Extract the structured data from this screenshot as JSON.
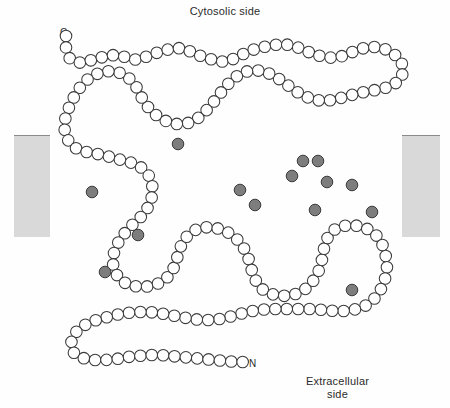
{
  "figure": {
    "type": "membrane-protein-topology-diagram",
    "title_top": "Cytosolic side",
    "label_bottom": "Extracellular\nside",
    "terminus_c": "C",
    "terminus_n": "N",
    "colors": {
      "background": "#fefefe",
      "residue_fill": "#ffffff",
      "residue_outline": "#3a3a3a",
      "highlighted_residue_fill": "#7d7d7d",
      "membrane_bar": "#d9d9d9",
      "membrane_bar_edge": "#8a8a8a",
      "text": "#2b2b2b"
    },
    "membrane_bars": [
      {
        "name": "membrane-bar-left",
        "x": 14,
        "y": 135,
        "w": 36,
        "h": 102
      },
      {
        "name": "membrane-bar-right",
        "x": 402,
        "y": 135,
        "w": 38,
        "h": 102
      }
    ],
    "residue_radius": 5.8,
    "residue_spacing": 11.4,
    "chain_path": [
      [
        66,
        36
      ],
      [
        66,
        48
      ],
      [
        70,
        59
      ],
      [
        81,
        63
      ],
      [
        92,
        60
      ],
      [
        103,
        57
      ],
      [
        114,
        55
      ],
      [
        126,
        57
      ],
      [
        137,
        60
      ],
      [
        148,
        56
      ],
      [
        159,
        52
      ],
      [
        170,
        49
      ],
      [
        181,
        48
      ],
      [
        192,
        52
      ],
      [
        203,
        57
      ],
      [
        214,
        60
      ],
      [
        225,
        62
      ],
      [
        236,
        58
      ],
      [
        247,
        52
      ],
      [
        258,
        48
      ],
      [
        269,
        46
      ],
      [
        280,
        44
      ],
      [
        291,
        45
      ],
      [
        302,
        49
      ],
      [
        313,
        54
      ],
      [
        324,
        57
      ],
      [
        335,
        58
      ],
      [
        346,
        55
      ],
      [
        357,
        50
      ],
      [
        368,
        47
      ],
      [
        379,
        47
      ],
      [
        390,
        51
      ],
      [
        399,
        58
      ],
      [
        404,
        68
      ],
      [
        401,
        79
      ],
      [
        392,
        86
      ],
      [
        381,
        89
      ],
      [
        370,
        91
      ],
      [
        359,
        93
      ],
      [
        348,
        96
      ],
      [
        337,
        99
      ],
      [
        326,
        101
      ],
      [
        315,
        100
      ],
      [
        304,
        96
      ],
      [
        294,
        90
      ],
      [
        285,
        83
      ],
      [
        276,
        77
      ],
      [
        266,
        72
      ],
      [
        255,
        70
      ],
      [
        244,
        72
      ],
      [
        234,
        78
      ],
      [
        226,
        86
      ],
      [
        219,
        95
      ],
      [
        212,
        104
      ],
      [
        205,
        112
      ],
      [
        197,
        119
      ],
      [
        188,
        123
      ],
      [
        177,
        124
      ],
      [
        166,
        121
      ],
      [
        156,
        115
      ],
      [
        148,
        107
      ],
      [
        142,
        98
      ],
      [
        137,
        88
      ],
      [
        130,
        79
      ],
      [
        121,
        73
      ],
      [
        110,
        71
      ],
      [
        99,
        73
      ],
      [
        89,
        78
      ],
      [
        81,
        86
      ],
      [
        75,
        95
      ],
      [
        70,
        105
      ],
      [
        66,
        115
      ],
      [
        64,
        126
      ],
      [
        66,
        137
      ],
      [
        72,
        146
      ],
      [
        81,
        151
      ],
      [
        92,
        153
      ],
      [
        103,
        155
      ],
      [
        114,
        158
      ],
      [
        125,
        161
      ],
      [
        136,
        164
      ],
      [
        145,
        170
      ],
      [
        151,
        179
      ],
      [
        153,
        190
      ],
      [
        151,
        201
      ],
      [
        146,
        211
      ],
      [
        139,
        219
      ],
      [
        131,
        226
      ],
      [
        124,
        234
      ],
      [
        118,
        243
      ],
      [
        114,
        253
      ],
      [
        113,
        264
      ],
      [
        116,
        274
      ],
      [
        123,
        282
      ],
      [
        133,
        286
      ],
      [
        144,
        287
      ],
      [
        155,
        285
      ],
      [
        165,
        280
      ],
      [
        172,
        272
      ],
      [
        176,
        262
      ],
      [
        179,
        251
      ],
      [
        183,
        241
      ],
      [
        190,
        233
      ],
      [
        199,
        228
      ],
      [
        210,
        227
      ],
      [
        221,
        229
      ],
      [
        231,
        234
      ],
      [
        239,
        241
      ],
      [
        245,
        250
      ],
      [
        249,
        260
      ],
      [
        252,
        271
      ],
      [
        256,
        281
      ],
      [
        262,
        289
      ],
      [
        271,
        294
      ],
      [
        282,
        296
      ],
      [
        293,
        295
      ],
      [
        303,
        291
      ],
      [
        311,
        284
      ],
      [
        317,
        275
      ],
      [
        321,
        265
      ],
      [
        323,
        254
      ],
      [
        325,
        243
      ],
      [
        330,
        233
      ],
      [
        338,
        227
      ],
      [
        349,
        225
      ],
      [
        360,
        226
      ],
      [
        370,
        230
      ],
      [
        378,
        237
      ],
      [
        383,
        246
      ],
      [
        386,
        257
      ],
      [
        387,
        268
      ],
      [
        385,
        279
      ],
      [
        381,
        289
      ],
      [
        375,
        298
      ],
      [
        367,
        305
      ],
      [
        357,
        309
      ],
      [
        346,
        311
      ],
      [
        335,
        311
      ],
      [
        324,
        310
      ],
      [
        313,
        309
      ],
      [
        302,
        309
      ],
      [
        291,
        309
      ],
      [
        280,
        309
      ],
      [
        269,
        309
      ],
      [
        258,
        310
      ],
      [
        247,
        312
      ],
      [
        236,
        315
      ],
      [
        225,
        318
      ],
      [
        214,
        320
      ],
      [
        203,
        320
      ],
      [
        192,
        319
      ],
      [
        181,
        317
      ],
      [
        170,
        315
      ],
      [
        159,
        313
      ],
      [
        148,
        312
      ],
      [
        137,
        312
      ],
      [
        126,
        313
      ],
      [
        115,
        315
      ],
      [
        104,
        318
      ],
      [
        93,
        321
      ],
      [
        83,
        326
      ],
      [
        75,
        333
      ],
      [
        71,
        343
      ],
      [
        74,
        353
      ],
      [
        83,
        358
      ],
      [
        94,
        360
      ],
      [
        105,
        360
      ],
      [
        116,
        359
      ],
      [
        127,
        357
      ],
      [
        138,
        356
      ],
      [
        149,
        355
      ],
      [
        160,
        355
      ],
      [
        171,
        356
      ],
      [
        182,
        357
      ],
      [
        193,
        358
      ],
      [
        204,
        359
      ],
      [
        215,
        360
      ],
      [
        226,
        361
      ],
      [
        237,
        362
      ],
      [
        247,
        362
      ]
    ],
    "highlighted_residue_indices": [],
    "highlighted_residues": [
      {
        "x": 178,
        "y": 144
      },
      {
        "x": 92,
        "y": 192
      },
      {
        "x": 138,
        "y": 235
      },
      {
        "x": 105,
        "y": 272
      },
      {
        "x": 240,
        "y": 190
      },
      {
        "x": 255,
        "y": 205
      },
      {
        "x": 303,
        "y": 161
      },
      {
        "x": 318,
        "y": 161
      },
      {
        "x": 292,
        "y": 176
      },
      {
        "x": 327,
        "y": 182
      },
      {
        "x": 315,
        "y": 210
      },
      {
        "x": 352,
        "y": 185
      },
      {
        "x": 372,
        "y": 212
      },
      {
        "x": 352,
        "y": 290
      }
    ],
    "helices": [
      {
        "name": "transmembrane-helix-1",
        "top": [
          77,
          137
        ],
        "bottom": [
          118,
          248
        ]
      },
      {
        "name": "transmembrane-helix-2",
        "top": [
          142,
          100
        ],
        "bottom": [
          175,
          263
        ]
      },
      {
        "name": "transmembrane-helix-3",
        "top": [
          206,
          112
        ],
        "bottom": [
          180,
          250
        ]
      },
      {
        "name": "transmembrane-helix-4",
        "top": [
          249,
          260
        ],
        "bottom": [
          246,
          252
        ]
      },
      {
        "name": "transmembrane-helix-5",
        "top": [
          285,
          84
        ],
        "bottom": [
          319,
          272
        ]
      },
      {
        "name": "transmembrane-helix-6",
        "top": [
          324,
          243
        ],
        "bottom": [
          323,
          255
        ]
      },
      {
        "name": "transmembrane-helix-7",
        "top": [
          386,
          257
        ],
        "bottom": [
          380,
          240
        ]
      }
    ]
  }
}
